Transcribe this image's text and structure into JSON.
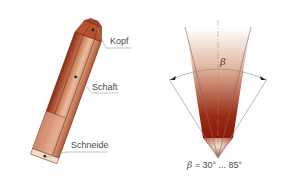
{
  "left_diagram": {
    "title": "Chisel parts",
    "labels": {
      "head": "Kopf",
      "shaft": "Schaft",
      "edge": "Schneide"
    }
  },
  "right_diagram": {
    "title": "Wedge angle",
    "angle_symbol": "β",
    "formula": {
      "symbol": "β",
      "text": " = 30° ... 85°"
    }
  },
  "colors": {
    "chisel_dark": "#8b2a14",
    "chisel_mid": "#c0704a",
    "chisel_light": "#e8b89a",
    "wedge_top": "#f5e6dc",
    "wedge_bottom": "#8b1a0a",
    "line": "#8a8a8a"
  }
}
